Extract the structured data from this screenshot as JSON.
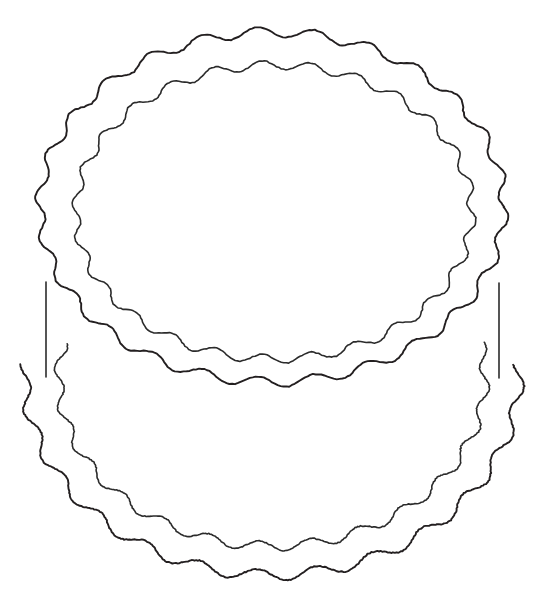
{
  "artwork": {
    "title": "Two-tier round cake outline",
    "subject": "layer-cake",
    "style": "coloring-book line art",
    "caption": "Black outline drawing of a round two-layer cake with wavy scalloped frosting edges on a plain white background.",
    "canvas": {
      "width": 546,
      "height": 612,
      "background_color": "#ffffff"
    },
    "ink": {
      "stroke_color": "#231f20",
      "secondary_stroke_color": "#2b2b2b",
      "stroke_width": 1.9,
      "fill": "none"
    },
    "parts": [
      {
        "name": "top-tier-outer-rim",
        "label": "Top tier outer scalloped rim",
        "shape": "wavy ellipse",
        "center": [
          272,
          207
        ],
        "radius_x": 232,
        "radius_y": 175,
        "wave_count": 26,
        "wave_amplitude": 5.0
      },
      {
        "name": "top-tier-inner-rim",
        "label": "Top tier inner scalloped rim (cake top surface)",
        "shape": "wavy ellipse",
        "center": [
          274,
          212
        ],
        "radius_x": 198,
        "radius_y": 147,
        "wave_count": 26,
        "wave_amplitude": 4.5
      },
      {
        "name": "bottom-tier-outer-rim",
        "label": "Bottom tier outer scalloped contour",
        "shape": "wavy arc",
        "center": [
          272,
          375
        ],
        "radius_x": 247,
        "radius_y": 200,
        "wave_count": 26,
        "wave_amplitude": 5.5
      },
      {
        "name": "bottom-tier-inner-rim",
        "label": "Bottom tier inner scalloped contour",
        "shape": "wavy arc",
        "center": [
          272,
          378
        ],
        "radius_x": 213,
        "radius_y": 168,
        "wave_count": 26,
        "wave_amplitude": 4.8
      },
      {
        "name": "left-side-seam",
        "label": "Left vertical side seam between tiers",
        "shape": "line",
        "from": [
          46,
          282
        ],
        "to": [
          46,
          377
        ]
      },
      {
        "name": "right-side-seam",
        "label": "Right vertical side seam between tiers",
        "shape": "line",
        "from": [
          499,
          283
        ],
        "to": [
          499,
          378
        ]
      }
    ],
    "extents": {
      "top_tier_left_x": 40,
      "top_tier_right_x": 504,
      "top_tier_top_y": 33,
      "bottom_tier_left_x": 25,
      "bottom_tier_right_x": 521,
      "bottom_tier_bottom_y": 578
    }
  }
}
